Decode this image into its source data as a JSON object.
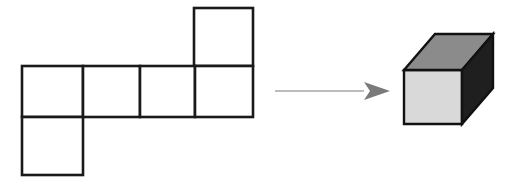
{
  "figure": {
    "background_color": "#ffffff",
    "net": {
      "name": "cube-net",
      "description": "Net of six squares arranged in a cross-like T shape",
      "stroke_color": "#1a1a1a",
      "fill_color": "#ffffff",
      "stroke_width": 2.6,
      "square_count": 6,
      "squares": [
        {
          "id": "net-square-top-right",
          "label": "top row square",
          "x": 194,
          "y": 8,
          "w": 59,
          "h": 58
        },
        {
          "id": "net-square-middle-1",
          "label": "middle row square 1",
          "x": 22,
          "y": 66,
          "w": 61,
          "h": 51
        },
        {
          "id": "net-square-middle-2",
          "label": "middle row square 2",
          "x": 83,
          "y": 66,
          "w": 57,
          "h": 51
        },
        {
          "id": "net-square-middle-3",
          "label": "middle row square 3",
          "x": 140,
          "y": 66,
          "w": 55,
          "h": 51
        },
        {
          "id": "net-square-middle-4",
          "label": "middle row square 4",
          "x": 195,
          "y": 66,
          "w": 58,
          "h": 51
        },
        {
          "id": "net-square-bottom-left",
          "label": "bottom row square",
          "x": 22,
          "y": 117,
          "w": 61,
          "h": 58
        }
      ]
    },
    "arrow": {
      "name": "transformation-arrow",
      "color": "#7a7a7a",
      "shaft_width": 1.2,
      "start_x": 275,
      "end_x": 390,
      "y": 91,
      "head_length": 26,
      "head_half_height": 9
    },
    "cube": {
      "name": "folded-cube",
      "description": "Isometric cube with shaded faces",
      "outline_color": "#111111",
      "outline_width": 2.4,
      "faces": [
        {
          "id": "cube-face-front",
          "label": "front face",
          "color": "#d9d9d9",
          "points": "404,70 462,70 462,124 404,124"
        },
        {
          "id": "cube-face-top",
          "label": "top face",
          "color": "#8b8b8b",
          "points": "404,70 435,34 493,34 462,70"
        },
        {
          "id": "cube-face-right",
          "label": "right face",
          "color": "#1f1f1f",
          "points": "462,70 493,34 493,88 462,124"
        }
      ]
    }
  }
}
